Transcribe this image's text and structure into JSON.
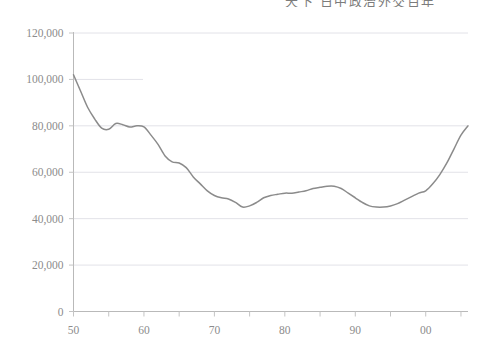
{
  "title": {
    "text": "天下  日中政治外交百年",
    "note": "clipped-at-top"
  },
  "colors": {
    "line": "#8b8b8b",
    "gridline": "#e2e2e8",
    "axis": "#b9b9b9",
    "tick": "#c4c4c4",
    "label": "#8c8c8c",
    "background": "#ffffff"
  },
  "chart_data": {
    "type": "line",
    "title": "天下  日中政治外交百年",
    "xlabel": "",
    "ylabel": "",
    "xlim": [
      1950,
      2006
    ],
    "ylim": [
      0,
      120000
    ],
    "grid": true,
    "legend": "none",
    "y_ticks": [
      0,
      20000,
      40000,
      60000,
      80000,
      100000,
      120000
    ],
    "y_tick_labels": [
      "0",
      "20,000",
      "40,000",
      "60,000",
      "80,000",
      "100,000",
      "120,000"
    ],
    "x_ticks": [
      1950,
      1960,
      1970,
      1980,
      1990,
      2000
    ],
    "x_tick_labels": [
      "50",
      "60",
      "70",
      "80",
      "90",
      "00"
    ],
    "x_minor_tick_interval": 5,
    "series": [
      {
        "name": "series-1",
        "x": [
          1950,
          1951,
          1952,
          1953,
          1954,
          1955,
          1956,
          1957,
          1958,
          1959,
          1960,
          1961,
          1962,
          1963,
          1964,
          1965,
          1966,
          1967,
          1968,
          1969,
          1970,
          1971,
          1972,
          1973,
          1974,
          1975,
          1976,
          1977,
          1978,
          1979,
          1980,
          1981,
          1982,
          1983,
          1984,
          1985,
          1986,
          1987,
          1988,
          1989,
          1990,
          1991,
          1992,
          1993,
          1994,
          1995,
          1996,
          1997,
          1998,
          1999,
          2000,
          2001,
          2002,
          2003,
          2004,
          2005,
          2006
        ],
        "values": [
          102000,
          95000,
          88000,
          83000,
          79000,
          78500,
          81000,
          80500,
          79500,
          80000,
          79500,
          76000,
          72000,
          67000,
          64500,
          64000,
          62000,
          58000,
          55000,
          52000,
          50000,
          49000,
          48500,
          47000,
          45000,
          45500,
          47000,
          49000,
          50000,
          50500,
          51000,
          51000,
          51500,
          52000,
          53000,
          53500,
          54000,
          54000,
          53000,
          51000,
          49000,
          47000,
          45500,
          45000,
          45000,
          45500,
          46500,
          48000,
          49500,
          51000,
          52000,
          55000,
          59000,
          64000,
          70000,
          76000,
          80000
        ]
      }
    ]
  },
  "axes": {
    "y_axis_label": "y-axis",
    "x_axis_label": "x-axis"
  }
}
